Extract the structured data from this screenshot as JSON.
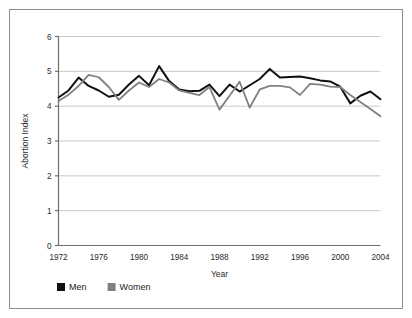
{
  "chart_data": {
    "type": "line",
    "title": "",
    "xlabel": "Year",
    "ylabel": "Abortion Index",
    "xlim": [
      1972,
      2004
    ],
    "ylim": [
      0,
      6
    ],
    "grid": true,
    "legend_position": "bottom-left",
    "ytick_labels": [
      "0",
      "1",
      "2",
      "3",
      "4",
      "5",
      "6"
    ],
    "yticks": [
      0,
      1,
      2,
      3,
      4,
      5,
      6
    ],
    "xtick_labels": [
      "1972",
      "1976",
      "1980",
      "1984",
      "1988",
      "1992",
      "1996",
      "2000",
      "2004"
    ],
    "xticks": [
      1972,
      1976,
      1980,
      1984,
      1988,
      1992,
      1996,
      2000,
      2004
    ],
    "x": [
      1972,
      1973,
      1974,
      1975,
      1976,
      1977,
      1978,
      1979,
      1980,
      1981,
      1982,
      1983,
      1984,
      1985,
      1986,
      1987,
      1988,
      1989,
      1990,
      1991,
      1992,
      1993,
      1994,
      1995,
      1996,
      1997,
      1998,
      1999,
      2000,
      2001,
      2002,
      2003,
      2004
    ],
    "series": [
      {
        "name": "Men",
        "color": "#111111",
        "values": [
          4.25,
          4.45,
          4.82,
          4.58,
          4.45,
          4.27,
          4.33,
          4.62,
          4.87,
          4.6,
          5.15,
          4.72,
          4.48,
          4.43,
          4.44,
          4.62,
          4.29,
          4.62,
          4.42,
          4.6,
          4.78,
          5.07,
          4.82,
          4.84,
          4.85,
          4.8,
          4.74,
          4.71,
          4.56,
          4.08,
          4.3,
          4.42,
          4.2
        ]
      },
      {
        "name": "Women",
        "color": "#808080",
        "values": [
          4.15,
          4.33,
          4.58,
          4.9,
          4.83,
          4.55,
          4.18,
          4.45,
          4.68,
          4.55,
          4.78,
          4.68,
          4.45,
          4.38,
          4.32,
          4.55,
          3.9,
          4.3,
          4.7,
          3.96,
          4.48,
          4.58,
          4.58,
          4.54,
          4.32,
          4.64,
          4.62,
          4.56,
          4.55,
          4.32,
          4.12,
          3.92,
          3.71
        ]
      }
    ]
  },
  "legend": {
    "items": [
      {
        "label": "Men",
        "color": "#111111"
      },
      {
        "label": "Women",
        "color": "#808080"
      }
    ]
  }
}
